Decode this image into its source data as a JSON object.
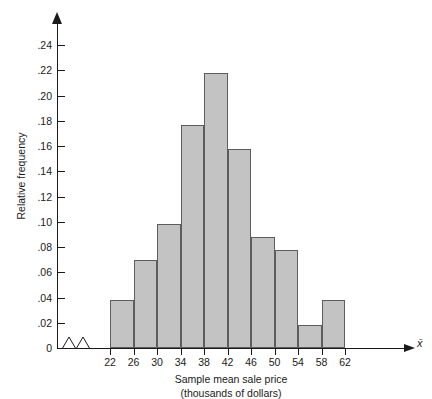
{
  "chart_data": {
    "type": "bar",
    "title": "",
    "subtitle": "",
    "xlabel": "Sample mean sale price",
    "xlabel_line2": "(thousands of dollars)",
    "ylabel": "Relative frequency",
    "x_axis_symbol": "x̄",
    "categories": [
      "22-26",
      "26-30",
      "30-34",
      "34-38",
      "38-42",
      "42-46",
      "46-50",
      "50-54",
      "54-58",
      "58-62"
    ],
    "bin_edges": [
      22,
      26,
      30,
      34,
      38,
      42,
      46,
      50,
      54,
      58,
      62
    ],
    "values": [
      0.038,
      0.07,
      0.098,
      0.177,
      0.218,
      0.158,
      0.088,
      0.078,
      0.018,
      0.038
    ],
    "xticks": [
      "22",
      "26",
      "30",
      "34",
      "38",
      "42",
      "46",
      "50",
      "54",
      "58",
      "62"
    ],
    "yticks": [
      "0",
      ".02",
      ".04",
      ".06",
      ".08",
      ".10",
      ".12",
      ".14",
      ".16",
      ".18",
      ".20",
      ".22",
      ".24"
    ],
    "ytick_values": [
      0,
      0.02,
      0.04,
      0.06,
      0.08,
      0.1,
      0.12,
      0.14,
      0.16,
      0.18,
      0.2,
      0.22,
      0.24
    ],
    "ylim": [
      0,
      0.25
    ],
    "xlim": [
      22,
      62
    ],
    "grid": false,
    "legend": false,
    "axis_break": true,
    "bar_fill_color": "#c3c3c3",
    "bar_edge_color": "#5d5d5d",
    "axis_color": "#1a1a1a"
  }
}
